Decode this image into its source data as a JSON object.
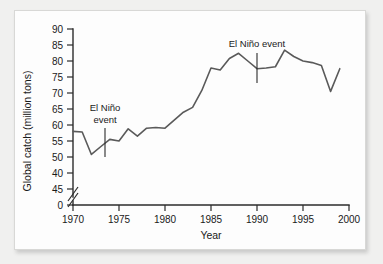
{
  "chart_data": {
    "type": "line",
    "title": "",
    "xlabel": "Year",
    "ylabel": "Global catch (million tons)",
    "xlim": [
      1970,
      2000
    ],
    "ylim": [
      45,
      90
    ],
    "grid": false,
    "legend": "none",
    "axis_break": {
      "axis": "y",
      "symbol": "double-slash",
      "between": [
        0,
        45
      ]
    },
    "x_ticks": [
      "1970",
      "1975",
      "1980",
      "1985",
      "1990",
      "1995",
      "2000"
    ],
    "x_tick_values": [
      1970,
      1975,
      1980,
      1985,
      1990,
      1995,
      2000
    ],
    "y_ticks": [
      "90",
      "85",
      "80",
      "75",
      "70",
      "65",
      "60",
      "55",
      "50",
      "40",
      "45",
      "0"
    ],
    "y_tick_values": [
      90,
      85,
      80,
      75,
      70,
      65,
      60,
      55,
      50,
      45,
      42.5,
      40.2
    ],
    "y_ticks_note": "As printed, the 40 and 45 labels appear transposed below 50; 0 sits beneath the axis break.",
    "series": [
      {
        "name": "Global catch",
        "x": [
          1970,
          1971,
          1972,
          1973,
          1974,
          1975,
          1976,
          1977,
          1978,
          1979,
          1980,
          1981,
          1982,
          1983,
          1984,
          1985,
          1986,
          1987,
          1988,
          1989,
          1990,
          1991,
          1992,
          1993,
          1994,
          1995,
          1996,
          1997,
          1998,
          1999
        ],
        "values": [
          58.0,
          57.8,
          50.8,
          53.2,
          55.5,
          55.0,
          58.8,
          56.5,
          59.0,
          59.2,
          59.0,
          61.5,
          64.0,
          65.5,
          70.8,
          77.8,
          77.2,
          80.8,
          82.4,
          80.0,
          77.6,
          77.8,
          78.2,
          83.4,
          81.4,
          80.0,
          79.5,
          78.6,
          70.5,
          77.6
        ]
      }
    ],
    "annotations": [
      {
        "id": "el-nino-1972",
        "lines": [
          "El Niño",
          "event"
        ],
        "target_x": 1972.4,
        "target_y": 52.5
      },
      {
        "id": "el-nino-1991",
        "lines": [
          "El Niño event"
        ],
        "target_x": 1990.8,
        "target_y": 77.7
      }
    ],
    "colors": {
      "line": "#5a5a5a",
      "axis": "#2b2b2b",
      "text": "#1a1a1a",
      "panel_background": "#fdfdfd",
      "page_background": "#f0f0ef"
    }
  }
}
